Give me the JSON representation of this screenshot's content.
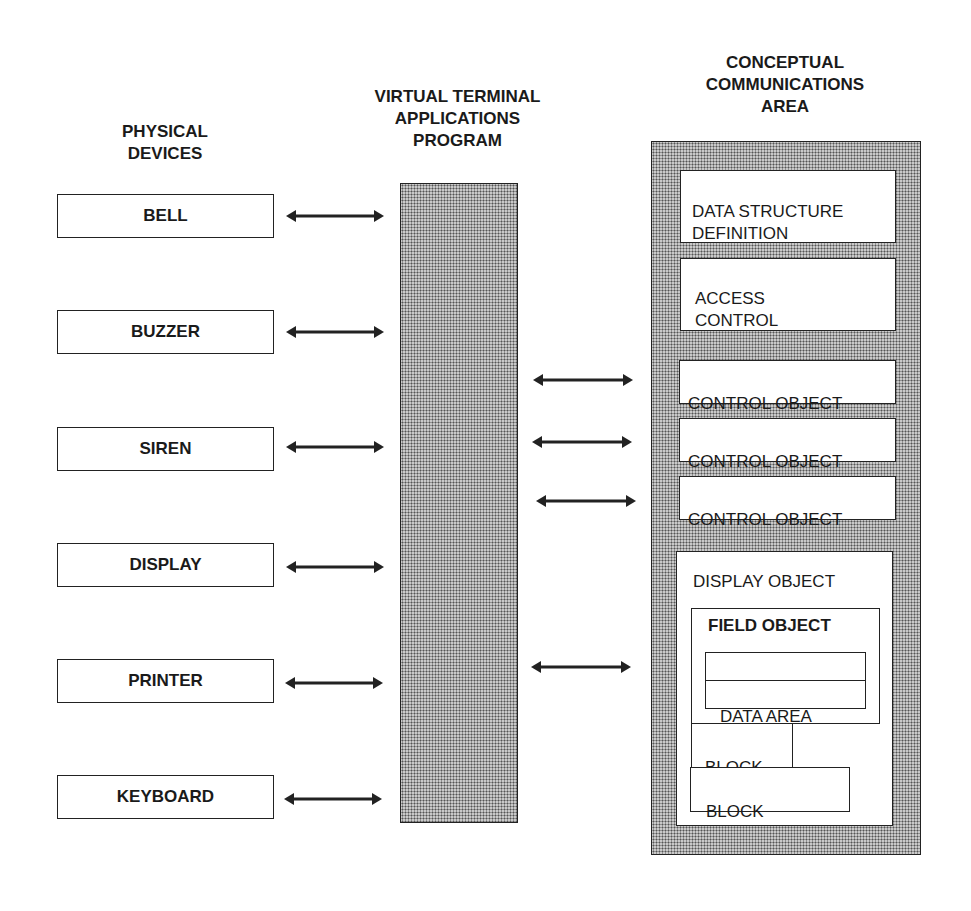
{
  "headings": {
    "physical_devices": "PHYSICAL\nDEVICES",
    "vt_program": "VIRTUAL TERMINAL\nAPPLICATIONS\nPROGRAM",
    "cca": "CONCEPTUAL\nCOMMUNICATIONS\nAREA"
  },
  "devices": [
    {
      "label": "BELL"
    },
    {
      "label": "BUZZER"
    },
    {
      "label": "SIREN"
    },
    {
      "label": "DISPLAY"
    },
    {
      "label": "PRINTER"
    },
    {
      "label": "KEYBOARD"
    }
  ],
  "cca": {
    "data_structure_definition": "DATA STRUCTURE\nDEFINITION",
    "access_control": "ACCESS\nCONTROL",
    "control_objects": [
      {
        "label": "CONTROL OBJECT"
      },
      {
        "label": "CONTROL OBJECT"
      },
      {
        "label": "CONTROL OBJECT"
      }
    ],
    "display_object": {
      "label": "DISPLAY OBJECT",
      "field_object": {
        "label": "FIELD OBJECT",
        "erco": "ERCO",
        "data_area": "DATA AREA"
      },
      "blocks": [
        {
          "label": "BLOCK"
        },
        {
          "label": "BLOCK"
        }
      ]
    }
  },
  "colors": {
    "line": "#222222",
    "shade": "#c9c9c9",
    "background": "#ffffff"
  }
}
